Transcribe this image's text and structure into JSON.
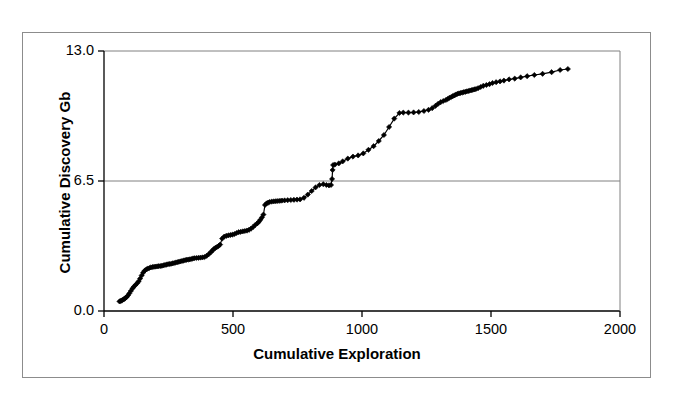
{
  "figure": {
    "border_color": "#8c8c8c",
    "background": "#ffffff",
    "marker_color": "#000000",
    "line_color": "#000000",
    "grid_color": "#808080"
  },
  "chart_data": {
    "type": "line",
    "title": "",
    "xlabel": "Cumulative Exploration",
    "ylabel": "Cumulative Discovery Gb",
    "xlim": [
      0,
      2000
    ],
    "ylim": [
      0.0,
      13.0
    ],
    "xticks": [
      0,
      500,
      1000,
      1500,
      2000
    ],
    "xtick_labels": [
      "0",
      "500",
      "1000",
      "1500",
      "2000"
    ],
    "yticks": [
      0.0,
      6.5,
      13.0
    ],
    "ytick_labels": [
      "0.0",
      "6.5",
      "13.0"
    ],
    "grid": "horizontal-at-6.5-and-13.0",
    "legend": "none",
    "marker": "diamond",
    "series": [
      {
        "name": "Cumulative discovery",
        "x": [
          60,
          64,
          68,
          72,
          76,
          80,
          84,
          88,
          93,
          98,
          104,
          110,
          116,
          122,
          128,
          134,
          140,
          146,
          152,
          158,
          164,
          170,
          176,
          182,
          188,
          194,
          200,
          206,
          212,
          218,
          224,
          230,
          236,
          242,
          248,
          254,
          260,
          266,
          272,
          278,
          284,
          290,
          296,
          302,
          308,
          314,
          320,
          326,
          332,
          338,
          344,
          350,
          358,
          366,
          374,
          382,
          390,
          398,
          406,
          414,
          420,
          426,
          432,
          438,
          444,
          450,
          458,
          466,
          474,
          482,
          490,
          498,
          506,
          514,
          522,
          530,
          538,
          546,
          554,
          562,
          570,
          578,
          586,
          594,
          600,
          606,
          612,
          618,
          624,
          630,
          636,
          642,
          650,
          658,
          666,
          674,
          682,
          690,
          700,
          712,
          724,
          736,
          748,
          760,
          775,
          790,
          805,
          820,
          835,
          850,
          862,
          872,
          880,
          884,
          886,
          888,
          895,
          910,
          925,
          945,
          965,
          985,
          1005,
          1025,
          1045,
          1065,
          1085,
          1105,
          1125,
          1145,
          1160,
          1180,
          1200,
          1220,
          1240,
          1258,
          1272,
          1285,
          1295,
          1305,
          1315,
          1325,
          1332,
          1339,
          1346,
          1352,
          1358,
          1364,
          1370,
          1376,
          1382,
          1388,
          1394,
          1400,
          1406,
          1412,
          1418,
          1424,
          1430,
          1436,
          1442,
          1450,
          1460,
          1470,
          1482,
          1494,
          1506,
          1520,
          1535,
          1550,
          1570,
          1592,
          1615,
          1640,
          1668,
          1700,
          1735,
          1768,
          1798
        ],
        "y": [
          0.48,
          0.5,
          0.52,
          0.55,
          0.58,
          0.62,
          0.66,
          0.7,
          0.78,
          0.88,
          1.0,
          1.12,
          1.22,
          1.3,
          1.38,
          1.48,
          1.62,
          1.78,
          1.92,
          2.02,
          2.08,
          2.12,
          2.15,
          2.18,
          2.2,
          2.21,
          2.22,
          2.23,
          2.24,
          2.25,
          2.26,
          2.28,
          2.3,
          2.32,
          2.34,
          2.35,
          2.36,
          2.38,
          2.4,
          2.42,
          2.44,
          2.46,
          2.48,
          2.5,
          2.52,
          2.54,
          2.56,
          2.57,
          2.58,
          2.6,
          2.62,
          2.64,
          2.65,
          2.66,
          2.67,
          2.68,
          2.7,
          2.76,
          2.84,
          2.94,
          3.02,
          3.1,
          3.16,
          3.2,
          3.25,
          3.32,
          3.62,
          3.72,
          3.76,
          3.78,
          3.8,
          3.82,
          3.85,
          3.9,
          3.94,
          3.96,
          3.98,
          4.0,
          4.02,
          4.06,
          4.12,
          4.2,
          4.3,
          4.38,
          4.46,
          4.56,
          4.68,
          4.82,
          5.3,
          5.38,
          5.42,
          5.45,
          5.47,
          5.48,
          5.49,
          5.5,
          5.51,
          5.52,
          5.53,
          5.54,
          5.55,
          5.56,
          5.57,
          5.58,
          5.66,
          5.82,
          6.0,
          6.18,
          6.3,
          6.34,
          6.3,
          6.28,
          6.3,
          6.6,
          7.05,
          7.3,
          7.32,
          7.38,
          7.48,
          7.62,
          7.72,
          7.78,
          7.88,
          8.06,
          8.24,
          8.5,
          8.8,
          9.2,
          9.62,
          9.9,
          9.92,
          9.92,
          9.93,
          9.95,
          10.0,
          10.06,
          10.14,
          10.26,
          10.36,
          10.44,
          10.5,
          10.55,
          10.6,
          10.66,
          10.7,
          10.74,
          10.78,
          10.82,
          10.86,
          10.88,
          10.9,
          10.92,
          10.94,
          10.96,
          10.98,
          11.0,
          11.02,
          11.04,
          11.06,
          11.08,
          11.1,
          11.14,
          11.2,
          11.26,
          11.3,
          11.34,
          11.4,
          11.44,
          11.48,
          11.52,
          11.58,
          11.62,
          11.68,
          11.74,
          11.8,
          11.86,
          11.94,
          12.05,
          12.1
        ]
      }
    ]
  }
}
